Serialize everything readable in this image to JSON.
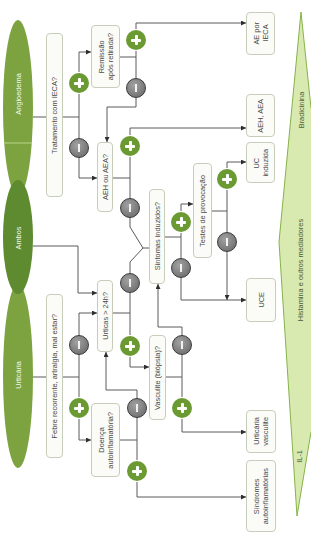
{
  "colors": {
    "yes": "#6b9a32",
    "no": "#767676",
    "ellipse": "#7ca340",
    "ellipse_dark": "#5e8b30",
    "mediator_fill": "#d8eab0",
    "mediator_stroke": "#86b24a"
  },
  "categories": {
    "angioedema": "Angioedema",
    "ambos": "Ambos",
    "urticaria": "Urticária"
  },
  "nodes": {
    "tratamento_ieca": "Tratamento com IECA?",
    "remissao": "Remissão\napós retirada?",
    "ae_por_ieca": "AE por\nIECA",
    "aeh_ou_aea": "AEH ou AEA?",
    "aeh_aea": "AEH, AEA",
    "uc_induzida": "UC\ninduzida",
    "testes_provocacao": "Testes de provocação",
    "sintomas_induzidos": "Sintomas induzidos?",
    "uce": "UCE",
    "urticas_24h": "Urticas > 24h?",
    "vasculite": "Vasculite (biópsia)?",
    "urticaria_vasculite": "Urticária\nvasculite",
    "sindromes": "Síndromes\nautoinflamatórias",
    "doenca_autoinflamatoria": "Doença\nautoinflamatória?",
    "febre": "Febre recorrente, artralgia, mal estar?"
  },
  "mediators": {
    "top": "Bradicinina",
    "middle": "Histamina e outros mediadores",
    "bottom": "IL-1"
  },
  "symbols": {
    "yes": "plus-icon",
    "no": "minus-icon"
  },
  "edges": [
    {
      "from": "Angioedema",
      "to": "Tratamento com IECA?"
    },
    {
      "from": "Ambos",
      "to": "Urticas > 24h?"
    },
    {
      "from": "Urticária",
      "to": "Febre recorrente, artralgia, mal estar?"
    },
    {
      "from": "Tratamento com IECA?",
      "answer": "+",
      "to": "Remissão após retirada?"
    },
    {
      "from": "Tratamento com IECA?",
      "answer": "-",
      "to": "AEH ou AEA?"
    },
    {
      "from": "Remissão após retirada?",
      "answer": "+",
      "to": "AE por IECA"
    },
    {
      "from": "Remissão após retirada?",
      "answer": "-",
      "to": "AEH ou AEA?"
    },
    {
      "from": "AEH ou AEA?",
      "answer": "+",
      "to": "AEH, AEA"
    },
    {
      "from": "AEH ou AEA?",
      "answer": "-",
      "to": "Sintomas induzidos?"
    },
    {
      "from": "Sintomas induzidos?",
      "answer": "+",
      "to": "Testes de provocação"
    },
    {
      "from": "Sintomas induzidos?",
      "answer": "-",
      "to": "UCE"
    },
    {
      "from": "Testes de provocação",
      "answer": "+",
      "to": "UC induzida"
    },
    {
      "from": "Testes de provocação",
      "answer": "-",
      "to": "UCE"
    },
    {
      "from": "Urticas > 24h?",
      "answer": "+",
      "to": "Vasculite (biópsia)?"
    },
    {
      "from": "Urticas > 24h?",
      "answer": "-",
      "to": "Sintomas induzidos?"
    },
    {
      "from": "Vasculite (biópsia)?",
      "answer": "+",
      "to": "Urticária vasculite"
    },
    {
      "from": "Vasculite (biópsia)?",
      "answer": "-",
      "to": "Sintomas induzidos?"
    },
    {
      "from": "Febre recorrente, artralgia, mal estar?",
      "answer": "+",
      "to": "Doença autoinflamatória?"
    },
    {
      "from": "Febre recorrente, artralgia, mal estar?",
      "answer": "-",
      "to": "Urticas > 24h?"
    },
    {
      "from": "Doença autoinflamatória?",
      "answer": "+",
      "to": "Síndromes autoinflamatórias"
    },
    {
      "from": "Doença autoinflamatória?",
      "answer": "-",
      "to": "Urticas > 24h?"
    }
  ]
}
